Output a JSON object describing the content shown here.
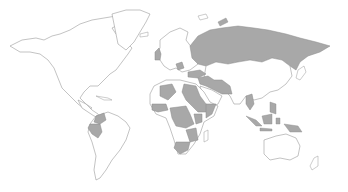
{
  "map": {
    "type": "world-choropleth",
    "projection": "equirectangular",
    "colors": {
      "background": "#ffffff",
      "land": "#ffffff",
      "border": "#9a9a9a",
      "highlight": "#a8a8a8"
    },
    "highlighted_regions": [
      "Russia",
      "United Kingdom",
      "Balkans",
      "Turkey",
      "Syria",
      "Iraq",
      "Iran",
      "Afghanistan",
      "Pakistan",
      "Libya",
      "Algeria",
      "Egypt",
      "Sudan",
      "Ethiopia",
      "Somalia",
      "Nigeria",
      "Central African Republic",
      "DR Congo",
      "Kenya",
      "Zimbabwe",
      "Mozambique",
      "South Africa",
      "Colombia",
      "Peru",
      "Myanmar",
      "Philippines",
      "Indonesia"
    ]
  }
}
